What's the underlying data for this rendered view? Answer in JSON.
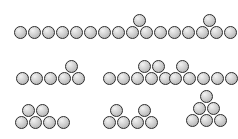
{
  "image": {
    "title": "Sphere-packing arrangement diagram",
    "background_color": "#ffffff",
    "width": 238,
    "height": 139
  },
  "ball_style": {
    "diameter": 13,
    "fill_color": "#cfcfcf",
    "highlight_color": "#f2f2f2",
    "outline_color": "#2b2b2b",
    "shape": "circle-sphere"
  },
  "groups": [
    {
      "id": "group-1",
      "name": "row1-left-flat-six",
      "description": "Six spheres in a single flat row",
      "count": 6,
      "origin": {
        "x": 14,
        "y": 5
      },
      "balls": [
        {
          "x": 0,
          "y": 21
        },
        {
          "x": 14,
          "y": 21
        },
        {
          "x": 28,
          "y": 21
        },
        {
          "x": 42,
          "y": 21
        },
        {
          "x": 56,
          "y": 21
        },
        {
          "x": 70,
          "y": 21
        }
      ]
    },
    {
      "id": "group-2",
      "name": "row1-middle-five-plus-one-center",
      "description": "Five spheres in a row with one sphere resting on top in the middle notch",
      "count": 6,
      "origin": {
        "x": 98,
        "y": 5
      },
      "balls": [
        {
          "x": 0,
          "y": 21
        },
        {
          "x": 14,
          "y": 21
        },
        {
          "x": 28,
          "y": 21
        },
        {
          "x": 42,
          "y": 21
        },
        {
          "x": 56,
          "y": 21
        },
        {
          "x": 35,
          "y": 9
        }
      ]
    },
    {
      "id": "group-3",
      "name": "row1-right-five-plus-one-center",
      "description": "Five spheres in a row with one sphere resting on top in the middle notch",
      "count": 6,
      "origin": {
        "x": 168,
        "y": 5
      },
      "balls": [
        {
          "x": 0,
          "y": 21
        },
        {
          "x": 14,
          "y": 21
        },
        {
          "x": 28,
          "y": 21
        },
        {
          "x": 42,
          "y": 21
        },
        {
          "x": 56,
          "y": 21
        },
        {
          "x": 35,
          "y": 9
        }
      ]
    },
    {
      "id": "group-4",
      "name": "row2-left-five-plus-one-right",
      "description": "Five spheres in a row with one sphere resting on top near the right end",
      "count": 6,
      "origin": {
        "x": 16,
        "y": 51
      },
      "balls": [
        {
          "x": 0,
          "y": 21
        },
        {
          "x": 14,
          "y": 21
        },
        {
          "x": 28,
          "y": 21
        },
        {
          "x": 42,
          "y": 21
        },
        {
          "x": 56,
          "y": 21
        },
        {
          "x": 49,
          "y": 9
        }
      ]
    },
    {
      "id": "group-5",
      "name": "row2-middle-five-plus-two-right",
      "description": "Five spheres in a row with two spheres resting on top toward the right",
      "count": 7,
      "origin": {
        "x": 103,
        "y": 51
      },
      "balls": [
        {
          "x": 0,
          "y": 21
        },
        {
          "x": 14,
          "y": 21
        },
        {
          "x": 28,
          "y": 21
        },
        {
          "x": 42,
          "y": 21
        },
        {
          "x": 56,
          "y": 21
        },
        {
          "x": 35,
          "y": 9
        },
        {
          "x": 49,
          "y": 9
        }
      ]
    },
    {
      "id": "group-6",
      "name": "row2-right-five-plus-one-left",
      "description": "Five spheres in a row with one sphere resting on top near the left end",
      "count": 6,
      "origin": {
        "x": 169,
        "y": 51
      },
      "balls": [
        {
          "x": 0,
          "y": 21
        },
        {
          "x": 14,
          "y": 21
        },
        {
          "x": 28,
          "y": 21
        },
        {
          "x": 42,
          "y": 21
        },
        {
          "x": 56,
          "y": 21
        },
        {
          "x": 7,
          "y": 9
        }
      ]
    },
    {
      "id": "group-7",
      "name": "row3-left-four-plus-two-left",
      "description": "Four spheres in a row with two spheres resting on top at the left",
      "count": 6,
      "origin": {
        "x": 15,
        "y": 95
      },
      "balls": [
        {
          "x": 0,
          "y": 21
        },
        {
          "x": 14,
          "y": 21
        },
        {
          "x": 28,
          "y": 21
        },
        {
          "x": 42,
          "y": 21
        },
        {
          "x": 7,
          "y": 9
        },
        {
          "x": 21,
          "y": 9
        }
      ]
    },
    {
      "id": "group-8",
      "name": "row3-middle-four-plus-two-split",
      "description": "Four spheres in a row with two separated spheres resting on top",
      "count": 6,
      "origin": {
        "x": 103,
        "y": 95
      },
      "balls": [
        {
          "x": 0,
          "y": 21
        },
        {
          "x": 14,
          "y": 21
        },
        {
          "x": 28,
          "y": 21
        },
        {
          "x": 42,
          "y": 21
        },
        {
          "x": 7,
          "y": 9
        },
        {
          "x": 35,
          "y": 9
        }
      ]
    },
    {
      "id": "group-9",
      "name": "row3-right-triangle-pyramid",
      "description": "Triangular pyramid of six spheres: three on the bottom, two in the middle, one on top",
      "count": 6,
      "origin": {
        "x": 186,
        "y": 89
      },
      "balls": [
        {
          "x": 0,
          "y": 25
        },
        {
          "x": 14,
          "y": 25
        },
        {
          "x": 28,
          "y": 25
        },
        {
          "x": 7,
          "y": 13
        },
        {
          "x": 21,
          "y": 13
        },
        {
          "x": 14,
          "y": 1
        }
      ]
    }
  ]
}
